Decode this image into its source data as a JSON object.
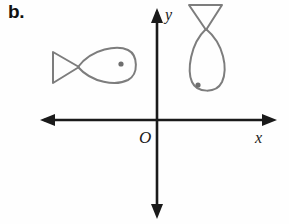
{
  "figure": {
    "part_label": "b.",
    "background_color": "#fefefe",
    "axis_color": "#1a1a1a",
    "shape_color": "#7d7d7d",
    "eye_color": "#6e6e6e"
  },
  "axes": {
    "origin_label": "O",
    "x_label": "x",
    "y_label": "y",
    "origin_px": {
      "x": 157,
      "y": 120
    },
    "x_axis": {
      "from_x": 40,
      "to_x": 277,
      "y": 120,
      "arrows": "both"
    },
    "y_axis": {
      "x": 157,
      "from_y": 8,
      "to_y": 219,
      "arrows": "both"
    }
  },
  "shapes": [
    {
      "name": "fish-left",
      "quadrant": 2,
      "orientation": "horizontal, nose pointing right",
      "tail": "triangle at left, apex pointing right",
      "eye": {
        "x": 121,
        "y": 64,
        "r": 2.6
      },
      "bounds": {
        "x": 52,
        "y": 48,
        "width": 86,
        "height": 38
      }
    },
    {
      "name": "fish-right",
      "quadrant": 1,
      "orientation": "rotated 90 degrees clockwise, nose pointing down",
      "tail": "triangle at top, apex pointing down",
      "eye": {
        "x": 198,
        "y": 85,
        "r": 2.6
      },
      "bounds": {
        "x": 187,
        "y": 4,
        "width": 38,
        "height": 94
      }
    }
  ]
}
